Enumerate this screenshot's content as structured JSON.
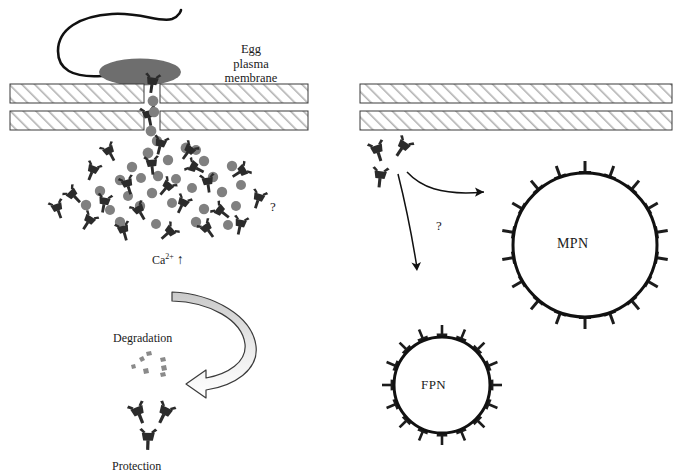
{
  "figure": {
    "background": "#ffffff",
    "width": 680,
    "height": 474
  },
  "colors": {
    "ink": "#111111",
    "molecule_dark": "#2b2b2b",
    "particle_gray": "#808080",
    "sperm_head_gray": "#6e6e6e",
    "hatch_line": "#b0b0b0",
    "membrane_border": "#3a3a3a",
    "arrow_fill_top": "#c9c9c9",
    "arrow_fill_bottom": "#ffffff",
    "fragment_gray": "#8a8a8a"
  },
  "labels": {
    "egg_membrane": [
      "Egg",
      "plasma",
      "membrane"
    ],
    "egg_membrane_text": "Egg plasma membrane",
    "calcium": "Ca",
    "calcium_superscript": "2+",
    "calcium_arrow": "↑",
    "degradation": "Degradation",
    "protection": "Protection",
    "question_left": "?",
    "question_right": "?",
    "mpn": "MPN",
    "fpn": "FPN"
  },
  "left_panel": {
    "name": "sperm-egg-fusion-panel",
    "sperm": {
      "head": {
        "cx": 140,
        "cy": 72,
        "rx": 41,
        "ry": 13,
        "fill": "#6e6e6e"
      },
      "tail_path": "M 100 76 C 70 78 58 70 58 52 C 58 30 78 16 110 14 C 142 12 160 22 171 18 C 178 15 180 10 180 10"
    },
    "membranes": [
      {
        "x": 10,
        "y": 84,
        "w": 298,
        "h": 19,
        "gap_x": 144,
        "gap_w": 16
      },
      {
        "x": 10,
        "y": 111,
        "w": 298,
        "h": 19,
        "gap_x": 144,
        "gap_w": 16
      }
    ],
    "pore_molecules": 2,
    "cloud": {
      "description": "dispersed Y-shaped nucleoprotein molecules and gray granules below the fusion pore",
      "molecule_count": 22,
      "granule_count": 28
    }
  },
  "right_panel": {
    "name": "nucleoprotein-fate-panel",
    "membranes": [
      {
        "x": 360,
        "y": 84,
        "w": 312,
        "h": 19
      },
      {
        "x": 360,
        "y": 111,
        "w": 312,
        "h": 19
      }
    ],
    "free_molecules": 3,
    "arrows": [
      {
        "name": "arrow-to-mpn",
        "from": [
          404,
          176
        ],
        "to": [
          486,
          196
        ]
      },
      {
        "name": "arrow-to-fpn",
        "from": [
          404,
          176
        ],
        "to": [
          418,
          274
        ]
      }
    ],
    "mpn_circle": {
      "cx": 585,
      "cy": 245,
      "r": 72,
      "spikes": 18,
      "label": "MPN"
    },
    "fpn_circle": {
      "cx": 442,
      "cy": 385,
      "r": 48,
      "spikes": 16,
      "label": "FPN"
    }
  },
  "recycle_arrow": {
    "name": "degradation-protection-arrow",
    "description": "thick hollow curved arrow sweeping clockwise from upper right down to the left",
    "start": [
      172,
      292
    ],
    "end": [
      196,
      383
    ]
  },
  "degradation_fragments": {
    "count": 7,
    "center": [
      148,
      372
    ]
  },
  "protection_molecules": {
    "count": 3,
    "center": [
      148,
      424
    ]
  }
}
